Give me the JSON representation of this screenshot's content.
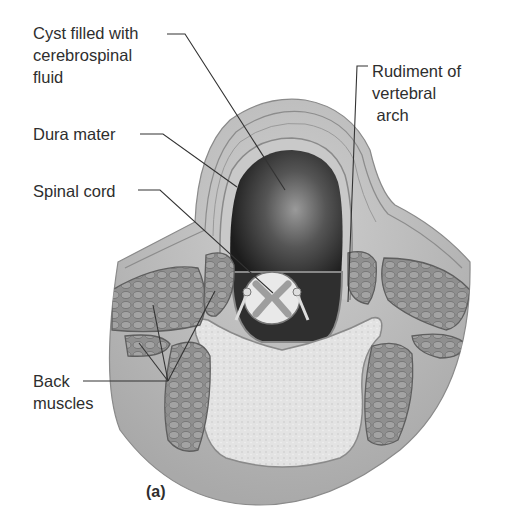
{
  "figure": {
    "panel_label": "(a)",
    "labels": {
      "cyst": [
        "Cyst filled with",
        "cerebrospinal",
        "fluid"
      ],
      "dura": "Dura mater",
      "cord": "Spinal cord",
      "arch": [
        "Rudiment of",
        "vertebral",
        " arch"
      ],
      "muscles": [
        "Back",
        "muscles"
      ]
    },
    "colors": {
      "tissue": "#b9b9b9",
      "tissue_light": "#d6d6d6",
      "cyst_dark": "#2a2a2a",
      "cyst_light": "#8a8a8a",
      "muscle": "#8e8e8e",
      "bone": "#e4e4e4",
      "leader": "#333333"
    }
  }
}
